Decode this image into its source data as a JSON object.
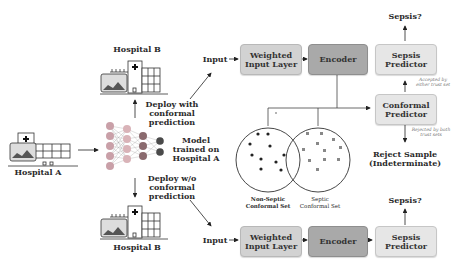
{
  "left": {
    "hospital_a_label": "Hospital A",
    "hospital_b_top_label": "Hospital B",
    "hospital_b_bottom_label": "Hospital B",
    "deploy_with_label": [
      "Deploy with",
      "conformal",
      "prediction"
    ],
    "deploy_without_label": [
      "Deploy w/o",
      "conformal",
      "prediction"
    ],
    "model_label": [
      "Model",
      "trained on",
      "Hospital A"
    ],
    "input_top_label": "Input",
    "input_bottom_label": "Input"
  },
  "top_pipeline": {
    "weighted_input_layer": [
      "Weighted",
      "Input Layer"
    ],
    "encoder": "Encoder",
    "sepsis_predictor": [
      "Sepsis",
      "Predictor"
    ],
    "conformal_predictor": [
      "Conformal",
      "Predictor"
    ],
    "output_label": "Sepsis?",
    "accepted_note": [
      "Accepted by",
      "either trust set"
    ],
    "rejected_note": [
      "Rejected by both",
      "trust sets"
    ],
    "reject_sample": [
      "Reject Sample",
      "(Indeterminate)"
    ]
  },
  "conformal_sets": {
    "non_septic_label": [
      "Non-Septic",
      "Conformal Set"
    ],
    "septic_label": [
      "Septic",
      "Conformal Set"
    ]
  },
  "bottom_pipeline": {
    "weighted_input_layer": [
      "Weighted",
      "Input Layer"
    ],
    "encoder": "Encoder",
    "sepsis_predictor": [
      "Sepsis",
      "Predictor"
    ],
    "output_label": "Sepsis?"
  },
  "colors": {
    "box_light": "#d2d2d2",
    "box_dark": "#a9a9a9",
    "box_pale": "#e6e6e6",
    "nn_layer1": "#c9a0a8",
    "nn_layer2": "#d9b3b8",
    "nn_layer3": "#8a6a6e",
    "nn_output": "#4a4a4a"
  }
}
